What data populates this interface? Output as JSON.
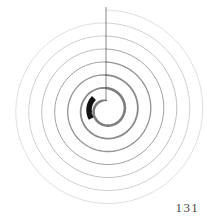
{
  "page": {
    "width": 207,
    "height": 219,
    "background_color": "#ffffff",
    "page_number": "131",
    "page_number_color": "#4a4a4a"
  },
  "figure": {
    "name": "archimedean-spiral-diagram",
    "center": {
      "x": 106,
      "y": 110
    },
    "start_point": {
      "x": 106,
      "y": 7
    },
    "radius_line": {
      "from": {
        "x": 106,
        "y": 7
      },
      "to": {
        "x": 106,
        "y": 110
      },
      "color": "#555555",
      "width": 0.7
    },
    "spiral": {
      "type": "archimedean",
      "turns": 7,
      "outer_radius": 100,
      "inner_radius": 9,
      "start_angle_deg": -90,
      "direction": "clockwise",
      "stroke_colors_outer_to_inner": [
        "#c9c9c9",
        "#bdbdbd",
        "#b0b0b0",
        "#a2a2a2",
        "#949494",
        "#8a8a8a",
        "#7e7e7e"
      ],
      "stroke_widths_outer_to_inner": [
        0.6,
        0.7,
        0.8,
        1.0,
        1.3,
        1.8,
        2.6
      ]
    },
    "highlight_arc": {
      "label": "thick-black-arc-segment",
      "color": "#121212",
      "width": 5.5,
      "radius": 17,
      "start_angle_deg": 150,
      "end_angle_deg": 225
    },
    "inner_hub": {
      "label": "white-center-hole",
      "radius": 9,
      "fill": "#ffffff"
    }
  }
}
